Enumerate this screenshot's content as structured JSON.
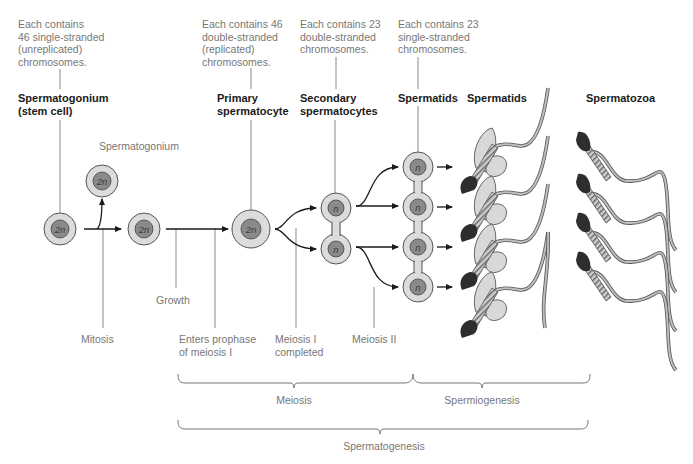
{
  "notes": {
    "stem": "Each contains\n46 single-stranded\n(unreplicated)\nchromosomes.",
    "primary": "Each contains 46\ndouble-stranded\n(replicated)\nchromosomes.",
    "secondary": "Each contains 23\ndouble-stranded\nchromosomes.",
    "spermatids": "Each contains 23\nsingle-stranded\nchromosomes."
  },
  "stages": {
    "stem_cell": "Spermatogonium\n(stem cell)",
    "spermatogonium": "Spermatogonium",
    "primary": "Primary\nspermatocyte",
    "secondary": "Secondary\nspermatocytes",
    "spermatids_1": "Spermatids",
    "spermatids_2": "Spermatids",
    "spermatozoa": "Spermatozoa"
  },
  "ploidy": {
    "diploid": "2n",
    "haploid": "n"
  },
  "events": {
    "mitosis": "Mitosis",
    "growth": "Growth",
    "prophase": "Enters prophase\nof meiosis I",
    "meiosis1": "Meiosis I\ncompleted",
    "meiosis2": "Meiosis II"
  },
  "brackets": {
    "meiosis": "Meiosis",
    "spermiogenesis": "Spermiogenesis",
    "spermatogenesis": "Spermatogenesis"
  },
  "colors": {
    "cell_outer": "#dcdcdc",
    "cell_nucleus": "#8a8a8a",
    "outline": "#555555",
    "head_dark": "#2e2e2e",
    "tail": "#bdbdbd",
    "text_gray": "#777777",
    "text_bold": "#1a1a1a"
  }
}
